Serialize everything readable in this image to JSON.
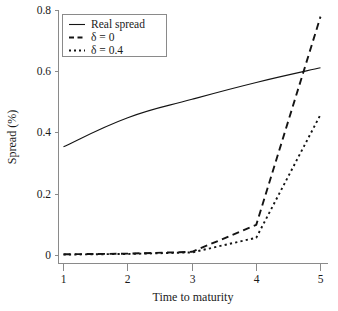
{
  "chart_data": {
    "type": "line",
    "title": "",
    "xlabel": "Time to maturity",
    "ylabel": "Spread (%)",
    "xlim": [
      1,
      5
    ],
    "ylim": [
      0,
      0.8
    ],
    "x": [
      1,
      2,
      3,
      4,
      5
    ],
    "xticks": [
      "1",
      "2",
      "3",
      "4",
      "5"
    ],
    "yticks": [
      "0",
      "0.2",
      "0.4",
      "0.6",
      "0.8"
    ],
    "ytick_values": [
      0,
      0.2,
      0.4,
      0.6,
      0.8
    ],
    "grid": false,
    "legend_position": "top-left",
    "series": [
      {
        "name": "Real spread",
        "style": "solid",
        "color": "#141414",
        "values": [
          0.355,
          0.45,
          0.51,
          0.565,
          0.613
        ]
      },
      {
        "name": "δ = 0",
        "style": "dashed",
        "color": "#141414",
        "values": [
          0.004,
          0.006,
          0.012,
          0.1,
          0.78
        ]
      },
      {
        "name": "δ = 0.4",
        "style": "dotted",
        "color": "#141414",
        "values": [
          0.003,
          0.005,
          0.01,
          0.058,
          0.46
        ]
      }
    ]
  },
  "legend": {
    "entries": [
      {
        "label": "Real spread"
      },
      {
        "label": "δ = 0"
      },
      {
        "label": "δ = 0.4"
      }
    ]
  },
  "axes": {
    "x_title": "Time to maturity",
    "y_title": "Spread (%)",
    "x_tick_labels": [
      "1",
      "2",
      "3",
      "4",
      "5"
    ],
    "y_tick_labels": [
      "0",
      "0.2",
      "0.4",
      "0.6",
      "0.8"
    ]
  },
  "colors": {
    "line": "#141414",
    "axis": "#8a8a8a",
    "background": "#ffffff"
  }
}
